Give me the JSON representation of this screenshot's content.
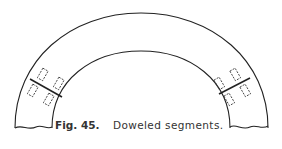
{
  "figure": {
    "number_label": "Fig. 45.",
    "caption": "Doweled segments.",
    "joints": [
      {
        "side": "left",
        "dowels": 4
      },
      {
        "side": "right",
        "dowels": 4
      }
    ],
    "colors": {
      "line": "#222222",
      "background": "#ffffff",
      "caption": "#333333"
    }
  }
}
